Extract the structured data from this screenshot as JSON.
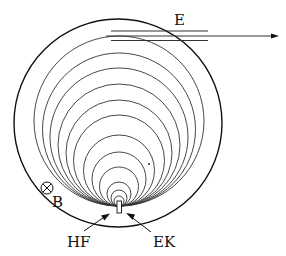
{
  "labels": {
    "e": "E",
    "b": "B",
    "hf": "HF",
    "ek": "EK"
  },
  "colors": {
    "stroke": "#111111",
    "inner_stroke": "#333333",
    "background": "#ffffff"
  },
  "outer_circle": {
    "cx": 118,
    "cy": 123,
    "r": 104
  },
  "tangent_point": {
    "x": 119,
    "y": 206
  },
  "inner_circle_tops_y": [
    36,
    53,
    68,
    84,
    100,
    115,
    135,
    152,
    167,
    182,
    190,
    196
  ],
  "beam_lines_y": [
    31,
    36,
    40
  ],
  "icons": {
    "b_field": "circle-cross-icon",
    "source": "source-rectangle-icon"
  }
}
